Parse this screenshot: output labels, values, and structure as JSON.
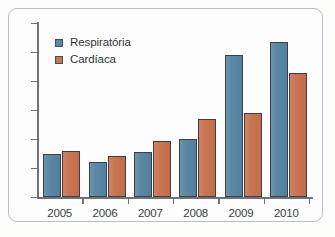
{
  "chart_data": {
    "type": "bar",
    "title": "",
    "xlabel": "",
    "ylabel": "",
    "categories": [
      "2005",
      "2006",
      "2007",
      "2008",
      "2009",
      "2010"
    ],
    "series": [
      {
        "name": "Respiratória",
        "color": "#5b87a3",
        "values": [
          148,
          120,
          155,
          200,
          490,
          533
        ]
      },
      {
        "name": "Cardíaca",
        "color": "#c97553",
        "values": [
          159,
          142,
          193,
          268,
          290,
          428
        ]
      }
    ],
    "ylim": [
      0,
      600
    ],
    "yticks": [
      0,
      100,
      200,
      300,
      400,
      500,
      600
    ],
    "ytick_labels": [
      "0",
      "100",
      "200",
      "300",
      "400",
      "500",
      "600"
    ],
    "grid": false,
    "legend_position": "top-left"
  },
  "legend": {
    "items": [
      {
        "label": "Respiratória",
        "color": "#5b87a3"
      },
      {
        "label": "Cardíaca",
        "color": "#c97553"
      }
    ]
  }
}
